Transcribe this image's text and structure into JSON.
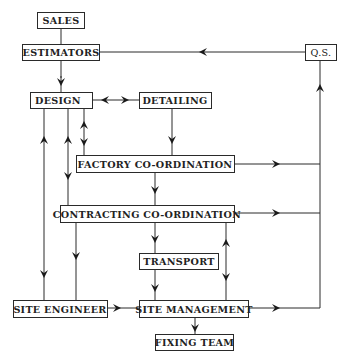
{
  "diagram": {
    "type": "organizational-flowchart",
    "nodes": [
      {
        "id": "sales",
        "label": "SALES"
      },
      {
        "id": "estimators",
        "label": "ESTIMATORS"
      },
      {
        "id": "qs",
        "label": "Q.S."
      },
      {
        "id": "design",
        "label": "DESIGN"
      },
      {
        "id": "detailing",
        "label": "DETAILING"
      },
      {
        "id": "factory",
        "label": "FACTORY CO-ORDINATION"
      },
      {
        "id": "contracting",
        "label": "CONTRACTING CO-ORDINATION"
      },
      {
        "id": "transport",
        "label": "TRANSPORT"
      },
      {
        "id": "site_engineer",
        "label": "SITE ENGINEER"
      },
      {
        "id": "site_management",
        "label": "SITE MANAGEMENT"
      },
      {
        "id": "fixing_team",
        "label": "FIXING TEAM"
      }
    ],
    "edges": [
      {
        "from": "sales",
        "to": "estimators",
        "arrow": "none"
      },
      {
        "from": "estimators",
        "to": "design",
        "arrow": "forward"
      },
      {
        "from": "qs",
        "to": "estimators",
        "arrow": "forward"
      },
      {
        "from": "design",
        "to": "detailing",
        "arrow": "both"
      },
      {
        "from": "detailing",
        "to": "factory",
        "arrow": "forward"
      },
      {
        "from": "design",
        "to": "factory",
        "arrow": "both"
      },
      {
        "from": "design",
        "to": "contracting",
        "arrow": "both"
      },
      {
        "from": "site_engineer",
        "to": "design",
        "arrow": "forward"
      },
      {
        "from": "factory",
        "to": "contracting",
        "arrow": "forward"
      },
      {
        "from": "factory",
        "to": "qs",
        "arrow": "forward"
      },
      {
        "from": "contracting",
        "to": "qs",
        "arrow": "forward"
      },
      {
        "from": "contracting",
        "to": "transport",
        "arrow": "forward"
      },
      {
        "from": "contracting",
        "to": "site_engineer",
        "arrow": "forward"
      },
      {
        "from": "contracting",
        "to": "site_management",
        "arrow": "both"
      },
      {
        "from": "transport",
        "to": "site_management",
        "arrow": "forward"
      },
      {
        "from": "site_engineer",
        "to": "site_management",
        "arrow": "forward"
      },
      {
        "from": "site_management",
        "to": "fixing_team",
        "arrow": "forward"
      },
      {
        "from": "site_management",
        "to": "qs",
        "arrow": "forward"
      }
    ]
  }
}
